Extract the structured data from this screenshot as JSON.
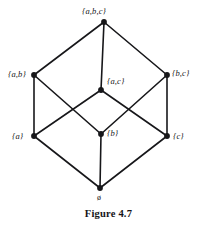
{
  "figure": {
    "caption": "Figure 4.7",
    "width": 217,
    "height": 229,
    "background_color": "#ffffff",
    "ink_color": "#17171a"
  },
  "chart_data": {
    "type": "diagram",
    "diagram_kind": "hasse-diagram",
    "title": "Figure 4.7",
    "nodes": [
      {
        "id": "abc",
        "label": "{a,b,c}",
        "x": 104,
        "y": 22,
        "label_x": 82,
        "label_y": 7,
        "label_anchor": "above"
      },
      {
        "id": "ab",
        "label": "{a,b}",
        "x": 34,
        "y": 75,
        "label_x": 8,
        "label_y": 70,
        "label_anchor": "left"
      },
      {
        "id": "ac",
        "label": "{a,c}",
        "x": 101,
        "y": 90,
        "label_x": 107,
        "label_y": 77,
        "label_anchor": "right"
      },
      {
        "id": "bc",
        "label": "{b,c}",
        "x": 167,
        "y": 75,
        "label_x": 172,
        "label_y": 69,
        "label_anchor": "right"
      },
      {
        "id": "a",
        "label": "{a}",
        "x": 34,
        "y": 136,
        "label_x": 12,
        "label_y": 132,
        "label_anchor": "left"
      },
      {
        "id": "b",
        "label": "{b}",
        "x": 101,
        "y": 134,
        "label_x": 107,
        "label_y": 129,
        "label_anchor": "right"
      },
      {
        "id": "c",
        "label": "{c}",
        "x": 167,
        "y": 136,
        "label_x": 173,
        "label_y": 132,
        "label_anchor": "right"
      },
      {
        "id": "empty",
        "label": "ø",
        "x": 100,
        "y": 188,
        "label_x": 97,
        "label_y": 194,
        "label_anchor": "below"
      }
    ],
    "edges": [
      {
        "from": "abc",
        "to": "ab"
      },
      {
        "from": "abc",
        "to": "ac"
      },
      {
        "from": "abc",
        "to": "bc"
      },
      {
        "from": "ab",
        "to": "a"
      },
      {
        "from": "ab",
        "to": "b"
      },
      {
        "from": "ac",
        "to": "a"
      },
      {
        "from": "ac",
        "to": "c"
      },
      {
        "from": "bc",
        "to": "b"
      },
      {
        "from": "bc",
        "to": "c"
      },
      {
        "from": "a",
        "to": "empty"
      },
      {
        "from": "b",
        "to": "empty"
      },
      {
        "from": "c",
        "to": "empty"
      }
    ],
    "node_radius": 2.9,
    "edge_width": 1.6,
    "edge_color": "#17171a",
    "node_color": "#17171a"
  }
}
